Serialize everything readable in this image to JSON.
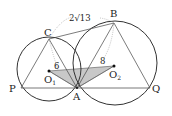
{
  "figure": {
    "points": {
      "A": {
        "label": "A",
        "x": 77,
        "y": 88
      },
      "P": {
        "label": "P",
        "x": 21,
        "y": 88
      },
      "Q": {
        "label": "Q",
        "x": 150,
        "y": 88
      },
      "B": {
        "label": "B",
        "x": 114,
        "y": 23
      },
      "C": {
        "label": "C",
        "x": 49,
        "y": 39
      },
      "O1": {
        "label": "O",
        "sub": "1",
        "x": 49,
        "y": 71
      },
      "O2": {
        "label": "O",
        "sub": "2",
        "x": 114,
        "y": 66
      }
    },
    "circles": [
      {
        "name": "circle-O1",
        "cx": 49,
        "cy": 69,
        "r": 32
      },
      {
        "name": "circle-O2",
        "cx": 115,
        "cy": 63,
        "r": 42
      }
    ],
    "lengths": {
      "CB": "2√13",
      "CO1": "6",
      "BO2": "8"
    },
    "colors": {
      "stroke": "#333333",
      "shade": "#c8c8c8",
      "dotted": "#888888"
    }
  }
}
